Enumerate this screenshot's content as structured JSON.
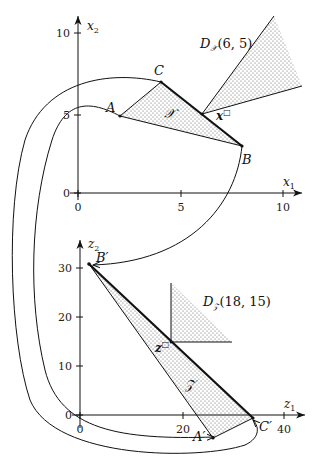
{
  "top_plot": {
    "x_axis_label": "x",
    "x_axis_sub": "1",
    "y_axis_label": "x",
    "y_axis_sub": "2",
    "x_ticks": [
      "0",
      "5",
      "10"
    ],
    "y_ticks": [
      "0",
      "5",
      "10"
    ],
    "points": {
      "A": "A",
      "B": "B",
      "C": "C"
    },
    "set_label": "𝒳",
    "point_label": "x",
    "point_sup": "□",
    "cone_label_main": "D",
    "cone_label_sub": "𝒳",
    "cone_label_args": "(6, 5)"
  },
  "bottom_plot": {
    "x_axis_label": "z",
    "x_axis_sub": "1",
    "y_axis_label": "z",
    "y_axis_sub": "2",
    "x_ticks": [
      "0",
      "20",
      "40"
    ],
    "y_ticks": [
      "0",
      "10",
      "20",
      "30"
    ],
    "points": {
      "A": "A′",
      "B": "B′",
      "C": "C′"
    },
    "set_label": "𝒵",
    "point_label": "z",
    "point_sup": "□",
    "cone_label_main": "D",
    "cone_label_sub": "𝒵",
    "cone_label_args": "(18, 15)"
  },
  "colors": {
    "line": "#111111",
    "dots": "#555555",
    "background": "#ffffff"
  }
}
